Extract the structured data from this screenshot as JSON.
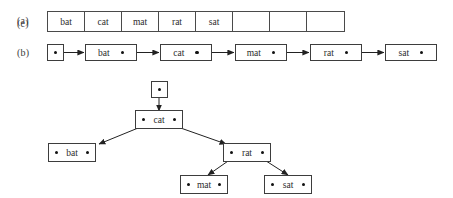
{
  "figure": {
    "background": "#ffffff",
    "line_color": "#3d3d3d",
    "text_color": "#2b2b2b",
    "keys": [
      "bat",
      "cat",
      "mat",
      "rat",
      "sat"
    ]
  },
  "parts": {
    "a": {
      "label": "(a)",
      "caption_name": "array-label"
    },
    "b": {
      "label": "(b)",
      "caption_name": "linked-list-label"
    },
    "c": {
      "label": "(c)",
      "caption_name": "tree-label"
    }
  },
  "array": {
    "cell_count": 8,
    "cells": [
      {
        "value": "bat",
        "empty": false
      },
      {
        "value": "cat",
        "empty": false
      },
      {
        "value": "mat",
        "empty": false
      },
      {
        "value": "rat",
        "empty": false
      },
      {
        "value": "sat",
        "empty": false
      },
      {
        "value": "",
        "empty": true
      },
      {
        "value": "",
        "empty": true
      },
      {
        "value": "",
        "empty": true
      }
    ]
  },
  "linked_list": {
    "head_pointer": {
      "name": "head-pointer-box",
      "dot": "•"
    },
    "nodes": [
      {
        "value": "bat"
      },
      {
        "value": "cat"
      },
      {
        "value": "mat"
      },
      {
        "value": "rat"
      },
      {
        "value": "sat"
      }
    ]
  },
  "tree": {
    "root_pointer": {
      "name": "root-pointer-box",
      "dot": "•"
    },
    "nodes": [
      {
        "id": "cat",
        "value": "cat",
        "level": 0
      },
      {
        "id": "bat",
        "value": "bat",
        "level": 1
      },
      {
        "id": "rat",
        "value": "rat",
        "level": 1
      },
      {
        "id": "mat",
        "value": "mat",
        "level": 2
      },
      {
        "id": "sat",
        "value": "sat",
        "level": 2
      }
    ],
    "edges": [
      {
        "from": "root-pointer",
        "to": "cat"
      },
      {
        "from": "cat",
        "to": "bat",
        "side": "left"
      },
      {
        "from": "cat",
        "to": "rat",
        "side": "right"
      },
      {
        "from": "rat",
        "to": "mat",
        "side": "left"
      },
      {
        "from": "rat",
        "to": "sat",
        "side": "right"
      }
    ]
  }
}
